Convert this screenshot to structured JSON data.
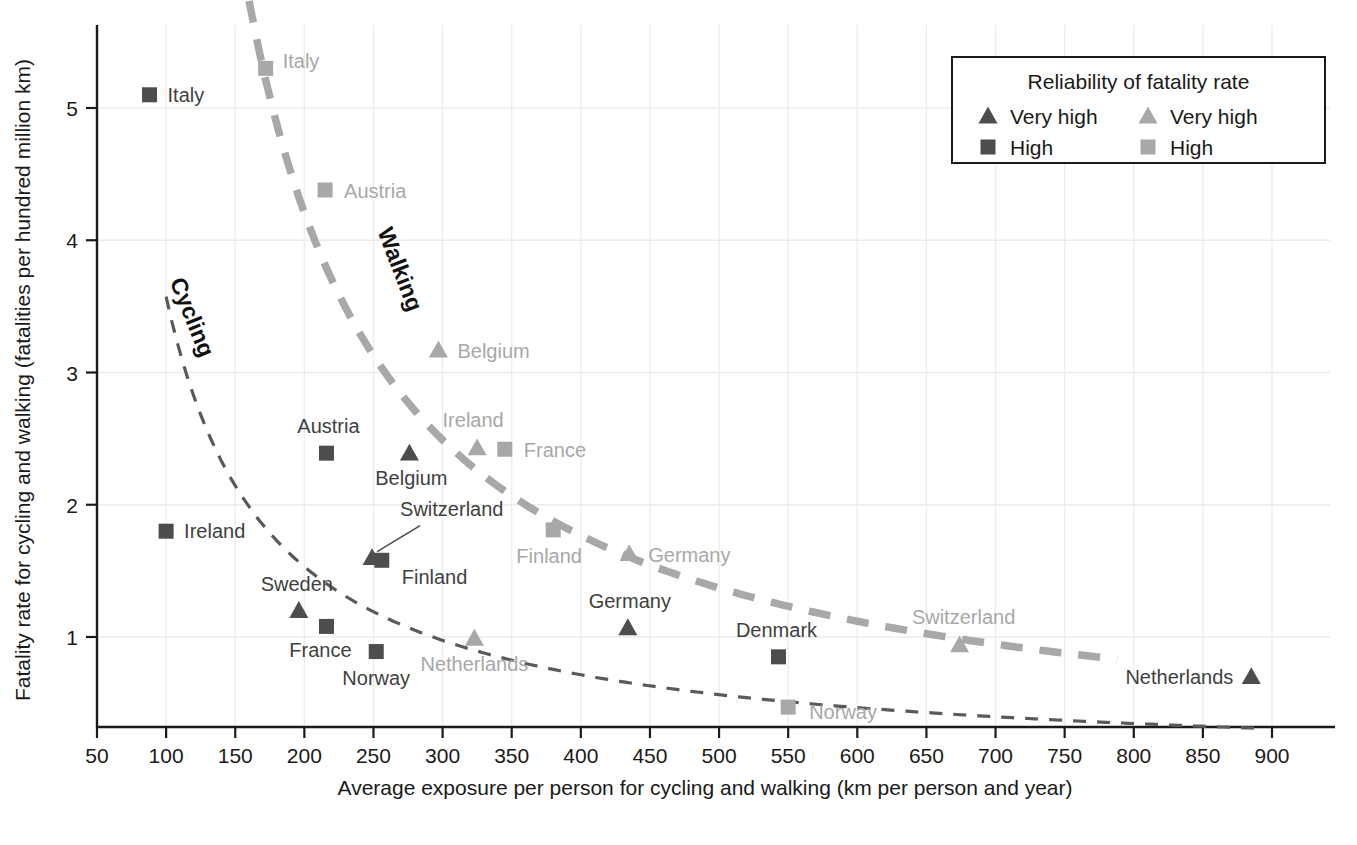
{
  "chart_data": {
    "type": "scatter",
    "title": "",
    "xlabel": "Average exposure per person for cycling and walking (km per person and year)",
    "ylabel": "Fatality rate  for cycling and walking (fatalities per hundred million km)",
    "xlim": [
      50,
      900
    ],
    "ylim": [
      0.35,
      5.6
    ],
    "xticks": [
      50,
      100,
      150,
      200,
      250,
      300,
      350,
      400,
      450,
      500,
      550,
      600,
      650,
      700,
      750,
      800,
      850,
      900
    ],
    "yticks": [
      1,
      2,
      3,
      4,
      5
    ],
    "grid": true,
    "legend": {
      "title": "Reliability of fatality rate",
      "position": "top-right",
      "entries": [
        {
          "marker": "triangle",
          "shade": "dark",
          "label": "Very high"
        },
        {
          "marker": "triangle",
          "shade": "light",
          "label": "Very high"
        },
        {
          "marker": "square",
          "shade": "dark",
          "label": "High"
        },
        {
          "marker": "square",
          "shade": "light",
          "label": "High"
        }
      ]
    },
    "series": [
      {
        "name": "Cycling",
        "shade": "dark",
        "curve_label": "Cycling",
        "line_style": "dashed-thin",
        "points": [
          {
            "country": "Italy",
            "x": 88,
            "y": 5.1,
            "marker": "square",
            "label_side": "right"
          },
          {
            "country": "Austria",
            "x": 216,
            "y": 2.39,
            "marker": "square",
            "label_side": "above"
          },
          {
            "country": "Belgium",
            "x": 276,
            "y": 2.39,
            "marker": "triangle",
            "label_side": "below"
          },
          {
            "country": "Ireland",
            "x": 100,
            "y": 1.8,
            "marker": "square",
            "label_side": "right"
          },
          {
            "country": "Switzerland",
            "x": 249,
            "y": 1.6,
            "marker": "triangle",
            "label_side": "leader"
          },
          {
            "country": "Finland",
            "x": 256,
            "y": 1.58,
            "marker": "square",
            "label_side": "below-right"
          },
          {
            "country": "Sweden",
            "x": 196,
            "y": 1.2,
            "marker": "triangle",
            "label_side": "above"
          },
          {
            "country": "France",
            "x": 216,
            "y": 1.08,
            "marker": "square",
            "label_side": "below"
          },
          {
            "country": "Norway",
            "x": 252,
            "y": 0.89,
            "marker": "square",
            "label_side": "below"
          },
          {
            "country": "Germany",
            "x": 434,
            "y": 1.07,
            "marker": "triangle",
            "label_side": "above"
          },
          {
            "country": "Denmark",
            "x": 543,
            "y": 0.85,
            "marker": "square",
            "label_side": "above"
          },
          {
            "country": "Netherlands",
            "x": 885,
            "y": 0.7,
            "marker": "triangle",
            "label_side": "left"
          }
        ]
      },
      {
        "name": "Walking",
        "shade": "light",
        "curve_label": "Walking",
        "line_style": "dashed-thick",
        "points": [
          {
            "country": "Italy",
            "x": 172,
            "y": 5.3,
            "marker": "square",
            "label_side": "right"
          },
          {
            "country": "Austria",
            "x": 215,
            "y": 4.38,
            "marker": "square",
            "label_side": "right"
          },
          {
            "country": "Belgium",
            "x": 297,
            "y": 3.17,
            "marker": "triangle",
            "label_side": "right"
          },
          {
            "country": "Ireland",
            "x": 325,
            "y": 2.43,
            "marker": "triangle",
            "label_side": "above"
          },
          {
            "country": "France",
            "x": 345,
            "y": 2.42,
            "marker": "square",
            "label_side": "right"
          },
          {
            "country": "Finland",
            "x": 380,
            "y": 1.81,
            "marker": "square",
            "label_side": "below"
          },
          {
            "country": "Germany",
            "x": 435,
            "y": 1.63,
            "marker": "triangle",
            "label_side": "right"
          },
          {
            "country": "Netherlands",
            "x": 323,
            "y": 0.99,
            "marker": "triangle",
            "label_side": "below"
          },
          {
            "country": "Switzerland",
            "x": 674,
            "y": 0.94,
            "marker": "triangle",
            "label_side": "above"
          },
          {
            "country": "Norway",
            "x": 550,
            "y": 0.47,
            "marker": "square",
            "label_side": "right"
          }
        ]
      }
    ],
    "colors": {
      "dark": "#4d4d4d",
      "light": "#a8a8a8",
      "axis": "#1a1a1a",
      "grid": "#ececec",
      "background": "#ffffff"
    }
  }
}
